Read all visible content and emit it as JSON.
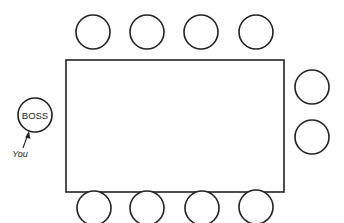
{
  "diagram": {
    "title": "",
    "table": {
      "shape": "rectangle"
    },
    "seats": {
      "top": [
        {
          "label": ""
        },
        {
          "label": ""
        },
        {
          "label": ""
        },
        {
          "label": ""
        }
      ],
      "bottom": [
        {
          "label": ""
        },
        {
          "label": ""
        },
        {
          "label": ""
        },
        {
          "label": ""
        }
      ],
      "right": [
        {
          "label": ""
        },
        {
          "label": ""
        }
      ],
      "left": [
        {
          "label": "BOSS"
        }
      ]
    },
    "annotations": {
      "you_label": "You",
      "you_points_to": "BOSS"
    },
    "colors": {
      "stroke": "#222222",
      "background": "#ffffff"
    }
  }
}
